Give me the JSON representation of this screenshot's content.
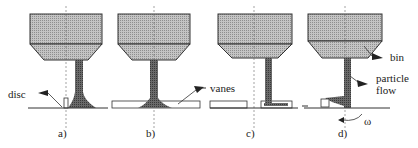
{
  "diagram": {
    "panels": [
      {
        "id": "a",
        "caption": "a)",
        "variant": "plain disc with small rim"
      },
      {
        "id": "b",
        "caption": "b)",
        "variant": "disc with flat vane plate"
      },
      {
        "id": "c",
        "caption": "c)",
        "variant": "disc with vanes, offset feed"
      },
      {
        "id": "d",
        "caption": "d)",
        "variant": "rotating disc with particle flow onto vane"
      }
    ],
    "labels": {
      "disc": "disc",
      "vanes": "vanes",
      "bin": "bin",
      "particle_flow_line1": "particle",
      "particle_flow_line2": "flow",
      "omega": "ω"
    },
    "colors": {
      "bin_fill": "#b8b8b8",
      "flow_fill": "#6e6e6e",
      "line": "#333333"
    }
  }
}
